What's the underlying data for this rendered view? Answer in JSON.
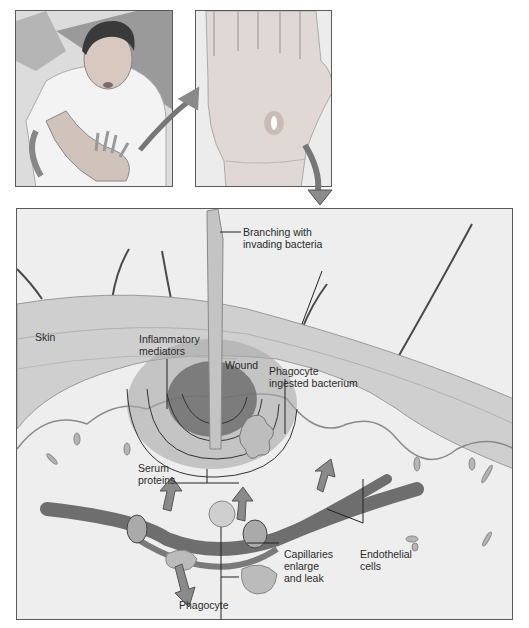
{
  "figure": {
    "panels": [
      {
        "id": "person",
        "description": "Boy with hand pierced by wood splinter"
      },
      {
        "id": "hand",
        "description": "Close-up of palm with puncture wound"
      },
      {
        "id": "main",
        "description": "Cross-section of skin showing inflammatory response"
      }
    ],
    "labels": {
      "branching": "Branching with\ninvading bacteria",
      "skin": "Skin",
      "inflammatory": "Inflammatory\nmediators",
      "wound": "Wound",
      "phagocyte_ingested": "Phagocyte\ningested bacterium",
      "serum": "Serum\nproteins",
      "capillaries": "Capillaries\nenlarge\nand leak",
      "endothelial": "Endothelial\ncells",
      "phagocyte": "Phagocyte"
    },
    "colors": {
      "arrow": "#8a8a8a",
      "border": "#5a5a5a",
      "skin_layer": "#c8c8c8",
      "tissue": "#e4e4e4",
      "capillary": "#6e6e6e"
    }
  }
}
